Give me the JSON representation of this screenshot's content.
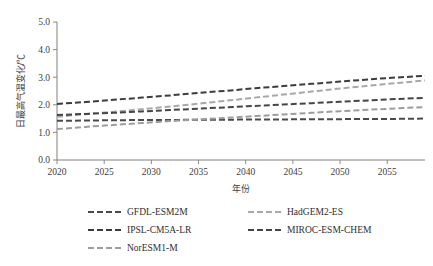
{
  "chart_data": {
    "type": "line",
    "title": "",
    "xlabel": "年份",
    "ylabel": "日最高气温变化/℃",
    "xlim": [
      2020,
      2059
    ],
    "ylim": [
      0.0,
      5.0
    ],
    "grid": false,
    "legend_position": "bottom",
    "xticks": [
      "2020",
      "2025",
      "2030",
      "2035",
      "2040",
      "2045",
      "2050",
      "2055"
    ],
    "xtick_values": [
      2020,
      2025,
      2030,
      2035,
      2040,
      2045,
      2050,
      2055
    ],
    "yticks": [
      "0.0",
      "1.0",
      "2.0",
      "3.0",
      "4.0",
      "5.0"
    ],
    "ytick_values": [
      0.0,
      1.0,
      2.0,
      3.0,
      4.0,
      5.0
    ],
    "x": [
      2020,
      2023,
      2026,
      2029,
      2032,
      2035,
      2038,
      2041,
      2044,
      2047,
      2050,
      2053,
      2056,
      2059
    ],
    "series": [
      {
        "name": "GFDL-ESM2M",
        "color": "#4a4a4a",
        "dash": "6,3",
        "width": 2.0,
        "values": [
          1.42,
          1.43,
          1.44,
          1.45,
          1.45,
          1.46,
          1.46,
          1.47,
          1.47,
          1.48,
          1.48,
          1.49,
          1.49,
          1.5
        ]
      },
      {
        "name": "HadGEM2-ES",
        "color": "#a8a8a8",
        "dash": "6,3",
        "width": 2.0,
        "values": [
          1.57,
          1.66,
          1.75,
          1.84,
          1.94,
          2.04,
          2.15,
          2.26,
          2.37,
          2.48,
          2.59,
          2.69,
          2.79,
          2.88
        ]
      },
      {
        "name": "IPSL-CM5A-LR",
        "color": "#3c3c3c",
        "dash": "6,3",
        "width": 2.0,
        "values": [
          2.03,
          2.1,
          2.18,
          2.26,
          2.34,
          2.43,
          2.51,
          2.6,
          2.68,
          2.76,
          2.84,
          2.92,
          2.99,
          3.05
        ]
      },
      {
        "name": "MIROC-ESM-CHEM",
        "color": "#454545",
        "dash": "6,3",
        "width": 2.0,
        "values": [
          1.63,
          1.67,
          1.71,
          1.76,
          1.81,
          1.86,
          1.91,
          1.96,
          2.01,
          2.06,
          2.11,
          2.16,
          2.21,
          2.25
        ]
      },
      {
        "name": "NorESM1-M",
        "color": "#9d9d9d",
        "dash": "6,3",
        "width": 2.0,
        "values": [
          1.12,
          1.2,
          1.27,
          1.34,
          1.41,
          1.47,
          1.53,
          1.59,
          1.65,
          1.71,
          1.77,
          1.82,
          1.87,
          1.92
        ]
      }
    ],
    "legend_entries": [
      {
        "label": "GFDL-ESM2M",
        "color": "#4a4a4a"
      },
      {
        "label": "HadGEM2-ES",
        "color": "#a8a8a8"
      },
      {
        "label": "IPSL-CM5A-LR",
        "color": "#3c3c3c"
      },
      {
        "label": "MIROC-ESM-CHEM",
        "color": "#454545"
      },
      {
        "label": "NorESM1-M",
        "color": "#9d9d9d"
      }
    ]
  },
  "layout": {
    "plot_left": 57,
    "plot_right": 425,
    "plot_top": 22,
    "plot_bottom": 160
  }
}
